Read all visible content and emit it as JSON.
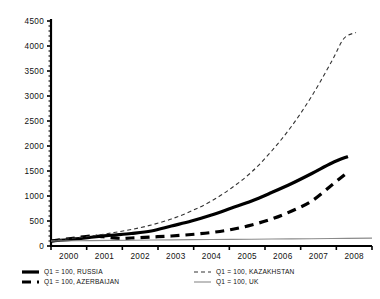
{
  "chart_data": {
    "type": "line",
    "title": "",
    "subtitle": "",
    "xlabel": "",
    "ylabel": "",
    "xlim": [
      2000,
      2008
    ],
    "ylim": [
      0,
      4500
    ],
    "ytick_step": 500,
    "y_minor_ticks": true,
    "grid": false,
    "legend_position": "bottom",
    "x": [
      2000,
      2001,
      2002,
      2003,
      2004,
      2005,
      2006,
      2007,
      2008
    ],
    "xticklabels": [
      "2000",
      "2001",
      "2002",
      "2003",
      "2004",
      "2005",
      "2006",
      "2007",
      "2008"
    ],
    "yticklabels": [
      "0",
      "500",
      "1000",
      "1500",
      "2000",
      "2500",
      "3000",
      "3500",
      "4000",
      "4500"
    ],
    "series": [
      {
        "name": "Q1 = 100, RUSSIA",
        "style": "solid-thick",
        "color": "#000000",
        "width": 3.2,
        "x": [
          2000,
          2000.5,
          2001,
          2001.5,
          2002,
          2002.5,
          2003,
          2003.5,
          2004,
          2004.5,
          2005,
          2005.5,
          2006,
          2006.5,
          2007,
          2007.4
        ],
        "values": [
          100,
          130,
          175,
          215,
          250,
          300,
          400,
          500,
          620,
          760,
          900,
          1070,
          1250,
          1450,
          1660,
          1790
        ]
      },
      {
        "name": "Q1 = 100, AZERBAIJAN",
        "style": "dashed-thick",
        "color": "#000000",
        "width": 3.2,
        "x": [
          2000,
          2000.5,
          2001,
          2001.3,
          2001.7,
          2002,
          2002.5,
          2003,
          2003.5,
          2004,
          2004.5,
          2005,
          2005.5,
          2006,
          2006.5,
          2007,
          2007.4
        ],
        "values": [
          100,
          150,
          200,
          185,
          150,
          160,
          180,
          200,
          230,
          270,
          330,
          420,
          540,
          700,
          900,
          1220,
          1480
        ]
      },
      {
        "name": "Q1 = 100, KAZAKHSTAN",
        "style": "dashed-thin",
        "color": "#333333",
        "width": 1.1,
        "x": [
          2000,
          2000.5,
          2001,
          2001.5,
          2002,
          2002.5,
          2003,
          2003.5,
          2004,
          2004.5,
          2005,
          2005.5,
          2006,
          2006.5,
          2007,
          2007.3,
          2007.6
        ],
        "values": [
          100,
          150,
          200,
          260,
          330,
          420,
          540,
          700,
          900,
          1160,
          1480,
          1900,
          2400,
          3000,
          3700,
          4150,
          4270
        ]
      },
      {
        "name": "Q1 = 100, UK",
        "style": "solid-thin",
        "color": "#8a8a8a",
        "width": 1.1,
        "x": [
          2000,
          2001,
          2002,
          2003,
          2004,
          2005,
          2006,
          2007,
          2008
        ],
        "values": [
          100,
          108,
          116,
          123,
          130,
          136,
          143,
          150,
          158
        ]
      }
    ]
  },
  "legend": {
    "entries": [
      {
        "label": "Q1 = 100, RUSSIA",
        "style": "solid-thick"
      },
      {
        "label": "Q1 = 100, AZERBAIJAN",
        "style": "dashed-thick"
      },
      {
        "label": "Q1 = 100, KAZAKHSTAN",
        "style": "dashed-thin"
      },
      {
        "label": "Q1 = 100, UK",
        "style": "solid-thin"
      }
    ]
  }
}
